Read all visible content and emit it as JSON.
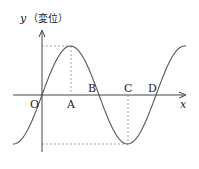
{
  "diagram": {
    "type": "sine-wave-displacement-graph",
    "y_axis_label": "y",
    "y_axis_unit": "（変位）",
    "x_axis_label": "x",
    "origin_label": "O",
    "points": [
      {
        "label": "A",
        "note": "crest position (below maximum)"
      },
      {
        "label": "B",
        "note": "zero crossing"
      },
      {
        "label": "C",
        "note": "trough position (above minimum)"
      },
      {
        "label": "D",
        "note": "zero crossing"
      }
    ],
    "colors": {
      "curve": "#555555",
      "axis": "#444444",
      "guide": "#888888"
    }
  }
}
